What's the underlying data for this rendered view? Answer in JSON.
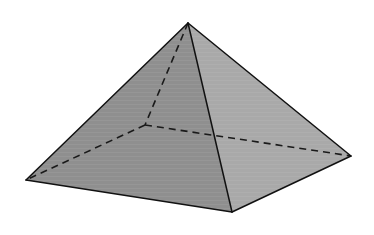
{
  "diagram": {
    "type": "square-pyramid",
    "title": "",
    "background": "#ffffff",
    "vertices": {
      "apex": [
        188,
        23
      ],
      "left": [
        26,
        180
      ],
      "front": [
        232,
        212
      ],
      "right": [
        351,
        156
      ],
      "back": [
        145,
        125
      ]
    },
    "faces": [
      {
        "name": "front-left-face",
        "points": [
          "apex",
          "left",
          "front"
        ],
        "fill": "#8f8f8f"
      },
      {
        "name": "front-right-face",
        "points": [
          "apex",
          "front",
          "right"
        ],
        "fill": "#a9a9a9"
      }
    ],
    "visible_edges": [
      [
        "apex",
        "left"
      ],
      [
        "apex",
        "front"
      ],
      [
        "apex",
        "right"
      ],
      [
        "left",
        "front"
      ],
      [
        "front",
        "right"
      ]
    ],
    "hidden_edges": [
      [
        "apex",
        "back"
      ],
      [
        "back",
        "left"
      ],
      [
        "back",
        "right"
      ]
    ],
    "stroke_color": "#111111",
    "hidden_stroke_color": "#1a1a1a"
  }
}
